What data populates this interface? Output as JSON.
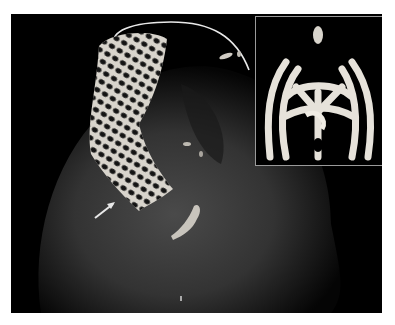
{
  "figure": {
    "main_view": {
      "subject": "stent",
      "annotation": "arrow pointing to stent distal end",
      "has_rotation_arc": true
    },
    "inset_view": {
      "subject": "stent end-on view",
      "border_color": "#9a9a9a"
    },
    "colors": {
      "background": "#000000",
      "tissue": "#3a3a3a",
      "stent": "#d8d4cc",
      "annotation": "#e8e8e8",
      "page": "#ffffff"
    }
  }
}
